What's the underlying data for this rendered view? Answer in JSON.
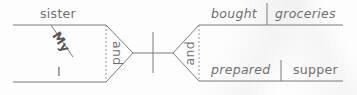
{
  "diagram": {
    "type": "sentence-diagram",
    "colors": {
      "line": "#7a7a7a",
      "text": "#6f6f6f",
      "dashed": "#9a9a9a"
    },
    "subject": {
      "words": [
        {
          "text": "sister",
          "role": "subject"
        },
        {
          "text": "I",
          "role": "subject"
        }
      ],
      "modifier": {
        "text": "My",
        "modifies": "sister"
      },
      "conjunction": "and"
    },
    "predicate": {
      "words": [
        {
          "verb": "bought",
          "object": "groceries"
        },
        {
          "verb": "prepared",
          "object": "supper"
        }
      ],
      "conjunction": "and"
    }
  }
}
